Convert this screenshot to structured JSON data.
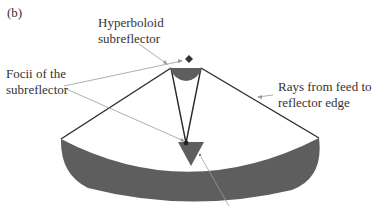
{
  "figure": {
    "panel_label": "(b)",
    "labels": {
      "hyperboloid": [
        "Hyperboloid",
        "subreflector"
      ],
      "focii": [
        "Focii of the",
        "subreflector"
      ],
      "rays": [
        "Rays from feed to",
        "reflector edge"
      ]
    },
    "colors": {
      "reflector_fill": "#5e5e5e",
      "ray_line": "#2b2b2b",
      "leader_line": "#9a9a9a",
      "text": "#333333",
      "background": "#ffffff"
    }
  }
}
